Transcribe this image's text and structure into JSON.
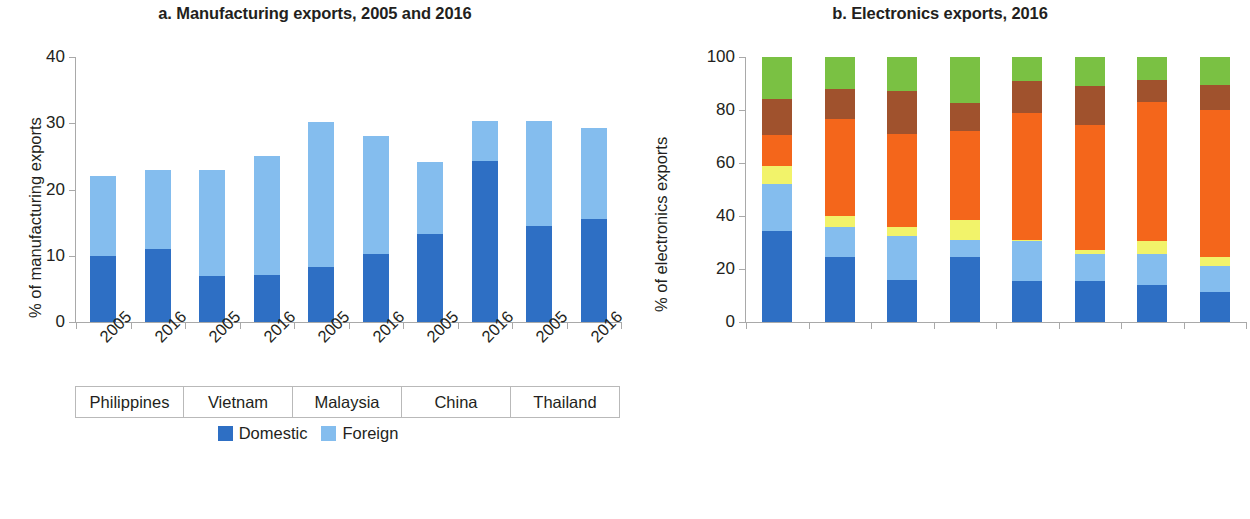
{
  "figure": {
    "panels": [
      "a",
      "b"
    ]
  },
  "panel_a": {
    "title": "a. Manufacturing exports, 2005 and 2016",
    "ylabel": "% of manufacturing exports",
    "yticks": [
      "0",
      "10",
      "20",
      "30",
      "40"
    ],
    "groups": [
      "Philippines",
      "Vietnam",
      "Malaysia",
      "China",
      "Thailand"
    ],
    "xlabels": [
      "2005",
      "2016",
      "2005",
      "2016",
      "2005",
      "2016",
      "2005",
      "2016",
      "2005",
      "2016"
    ],
    "legend": [
      {
        "label": "Domestic",
        "color": "#2e6fc4"
      },
      {
        "label": "Foreign",
        "color": "#84bdee"
      }
    ]
  },
  "panel_b": {
    "title": "b. Electronics exports, 2016",
    "ylabel": "% of electronics exports",
    "yticks": [
      "0",
      "20",
      "40",
      "60",
      "80",
      "100"
    ],
    "xlabels": [
      "Singapore",
      "Korea, Rep.",
      "China",
      "Japan",
      "Malaysia",
      "Vietnam",
      "Philippines",
      "Thailand"
    ],
    "legend": [
      {
        "label": "Business services",
        "color": "#2e6fc4"
      },
      {
        "label": "Financial",
        "color": "#84bdee"
      },
      {
        "label": "Wholesale and retail",
        "color": "#f4661b"
      },
      {
        "label": "Information technology and telecommunications",
        "color": "#f2f36a"
      },
      {
        "label": "Transportation",
        "color": "#a0522d"
      },
      {
        "label": "Rest",
        "color": "#7ac143"
      }
    ]
  },
  "chart_data": [
    {
      "type": "bar",
      "id": "a",
      "title": "a. Manufacturing exports, 2005 and 2016",
      "stacked": true,
      "xlabel": "",
      "ylabel": "% of manufacturing exports",
      "ylim": [
        0,
        40
      ],
      "yticks": [
        0,
        10,
        20,
        30,
        40
      ],
      "grid": false,
      "legend_position": "bottom-center",
      "categories": [
        "Philippines 2005",
        "Philippines 2016",
        "Vietnam 2005",
        "Vietnam 2016",
        "Malaysia 2005",
        "Malaysia 2016",
        "China 2005",
        "China 2016",
        "Thailand 2005",
        "Thailand 2016"
      ],
      "groups": [
        "Philippines",
        "Vietnam",
        "Malaysia",
        "China",
        "Thailand"
      ],
      "years": [
        "2005",
        "2016"
      ],
      "series": [
        {
          "name": "Domestic",
          "color": "#2e6fc4",
          "values": [
            10.0,
            11.0,
            7.0,
            7.1,
            8.3,
            10.3,
            13.3,
            24.3,
            14.5,
            15.5
          ]
        },
        {
          "name": "Foreign",
          "color": "#84bdee",
          "values": [
            12.0,
            12.0,
            16.0,
            17.9,
            21.9,
            17.8,
            10.9,
            6.0,
            15.8,
            13.8
          ]
        }
      ],
      "totals": [
        22.0,
        23.0,
        23.0,
        25.0,
        30.2,
        28.1,
        24.2,
        30.3,
        30.3,
        29.3
      ]
    },
    {
      "type": "bar",
      "id": "b",
      "title": "b. Electronics exports, 2016",
      "stacked": true,
      "xlabel": "",
      "ylabel": "% of electronics exports",
      "ylim": [
        0,
        100
      ],
      "yticks": [
        0,
        20,
        40,
        60,
        80,
        100
      ],
      "grid": false,
      "legend_position": "bottom-left",
      "categories": [
        "Singapore",
        "Korea, Rep.",
        "China",
        "Japan",
        "Malaysia",
        "Vietnam",
        "Philippines",
        "Thailand"
      ],
      "series": [
        {
          "name": "Business services",
          "color": "#2e6fc4",
          "values": [
            34.5,
            24.5,
            16.0,
            24.5,
            15.5,
            15.5,
            14.0,
            11.5
          ]
        },
        {
          "name": "Financial",
          "color": "#84bdee",
          "values": [
            17.5,
            11.5,
            16.5,
            6.5,
            15.0,
            10.0,
            11.5,
            9.5
          ]
        },
        {
          "name": "Information technology and telecommunications",
          "color": "#f2f36a",
          "values": [
            7.0,
            4.0,
            3.5,
            7.5,
            0.5,
            1.5,
            5.0,
            3.5
          ]
        },
        {
          "name": "Wholesale and retail",
          "color": "#f4661b",
          "values": [
            11.5,
            36.5,
            35.0,
            33.5,
            48.0,
            47.5,
            52.5,
            55.5
          ]
        },
        {
          "name": "Transportation",
          "color": "#a0522d",
          "values": [
            13.5,
            11.5,
            16.0,
            10.5,
            12.0,
            14.5,
            8.5,
            9.5
          ]
        },
        {
          "name": "Rest",
          "color": "#7ac143",
          "values": [
            16.0,
            12.0,
            13.0,
            17.5,
            9.0,
            11.0,
            8.5,
            10.5
          ]
        }
      ],
      "cumulative_tops": {
        "Singapore": [
          34.5,
          52.0,
          59.0,
          70.5,
          84.0,
          100.0
        ],
        "Korea, Rep.": [
          24.5,
          36.0,
          40.0,
          76.5,
          88.0,
          100.0
        ],
        "China": [
          16.0,
          32.5,
          36.0,
          71.0,
          87.0,
          100.0
        ],
        "Japan": [
          24.5,
          31.0,
          38.5,
          72.0,
          82.5,
          100.0
        ],
        "Malaysia": [
          15.5,
          30.5,
          31.0,
          79.0,
          91.0,
          100.0
        ],
        "Vietnam": [
          15.5,
          25.5,
          27.0,
          74.5,
          89.0,
          100.0
        ],
        "Philippines": [
          14.0,
          25.5,
          30.5,
          83.0,
          91.5,
          100.0
        ],
        "Thailand": [
          11.5,
          21.0,
          24.5,
          80.0,
          89.5,
          100.0
        ]
      }
    }
  ]
}
